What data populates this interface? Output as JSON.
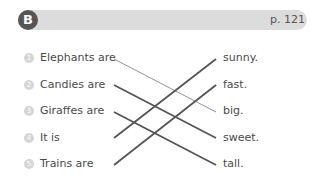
{
  "header": {
    "section_letter": "B",
    "page_ref": "p. 121"
  },
  "left_items": [
    {
      "num": "1",
      "text": "Elephants are"
    },
    {
      "num": "2",
      "text": "Candies are"
    },
    {
      "num": "3",
      "text": "Giraffes are"
    },
    {
      "num": "4",
      "text": "It is"
    },
    {
      "num": "5",
      "text": "Trains are"
    }
  ],
  "right_items": [
    {
      "text": "sunny."
    },
    {
      "text": "fast."
    },
    {
      "text": "big."
    },
    {
      "text": "sweet."
    },
    {
      "text": "tall."
    }
  ],
  "matches": [
    {
      "from": "Elephants are",
      "to": "big.",
      "style": "thin"
    },
    {
      "from": "Candies are",
      "to": "sweet.",
      "style": "thick"
    },
    {
      "from": "Giraffes are",
      "to": "tall.",
      "style": "thick"
    },
    {
      "from": "It is",
      "to": "sunny.",
      "style": "thick"
    },
    {
      "from": "Trains are",
      "to": "fast.",
      "style": "thick"
    }
  ]
}
